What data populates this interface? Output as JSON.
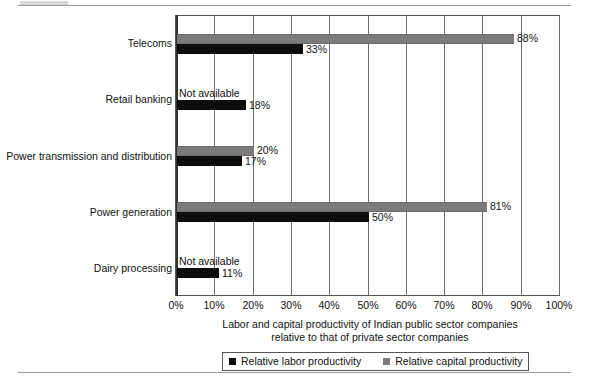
{
  "chart_data": {
    "type": "bar",
    "orientation": "horizontal",
    "title": "",
    "xlabel": "Labor and capital productivity of Indian public sector companies relative to that of private sector companies",
    "ylabel": "",
    "xlim": [
      0,
      100
    ],
    "x_unit": "%",
    "grid": true,
    "legend_position": "bottom",
    "categories": [
      "Telecoms",
      "Retail banking",
      "Power transmission and distribution",
      "Power generation",
      "Dairy processing"
    ],
    "xticks": [
      "0%",
      "10%",
      "20%",
      "30%",
      "40%",
      "50%",
      "60%",
      "70%",
      "80%",
      "90%",
      "100%"
    ],
    "xtick_values": [
      0,
      10,
      20,
      30,
      40,
      50,
      60,
      70,
      80,
      90,
      100
    ],
    "series": [
      {
        "name": "Relative labor productivity",
        "color": "#0d0d0d",
        "values": [
          33,
          18,
          17,
          50,
          11
        ],
        "labels": [
          "33%",
          "18%",
          "17%",
          "50%",
          "11%"
        ]
      },
      {
        "name": "Relative capital productivity",
        "color": "#7b7b7b",
        "values": [
          88,
          null,
          20,
          81,
          null
        ],
        "labels": [
          "88%",
          "Not available",
          "20%",
          "81%",
          "Not available"
        ]
      }
    ],
    "annotations": [
      "Not available",
      "Not available"
    ]
  },
  "axis_title": {
    "line1": "Labor and capital productivity of Indian public sector companies",
    "line2": "relative to that of private sector companies"
  },
  "legend": {
    "labor_label": "Relative labor productivity",
    "capital_label": "Relative capital productivity"
  },
  "colors": {
    "labor": "#0d0d0d",
    "capital": "#7b7b7b",
    "grid": "#6f6f6f",
    "frame": "#555555",
    "rule": "#9a9a9a"
  }
}
